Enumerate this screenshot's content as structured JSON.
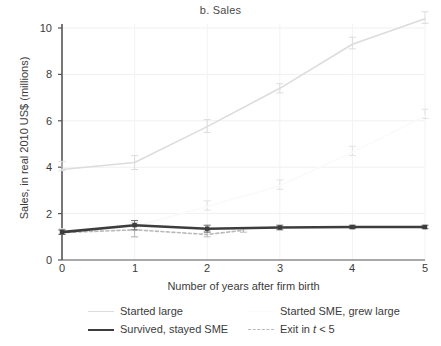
{
  "figure": {
    "title": "b. Sales",
    "xlabel": "Number of years after firm birth",
    "ylabel": "Sales, in real 2010 US$ (millions)"
  },
  "legend": {
    "items": [
      {
        "label": "Started large",
        "style": "solid-light-gray",
        "color": "#dcdcdc"
      },
      {
        "label": "Started SME, grew large",
        "style": "solid-near-white",
        "color": "#fafafa"
      },
      {
        "label": "Survived, stayed SME",
        "style": "solid-dark-thick",
        "color": "#3d3d3d"
      },
      {
        "label": "Exit in t < 5",
        "style": "dashed-gray",
        "color": "#b9b9b9"
      }
    ]
  },
  "axes": {
    "y_ticks": [
      "0",
      "2",
      "4",
      "6",
      "8",
      "10"
    ],
    "x_ticks": [
      "0",
      "1",
      "2",
      "3",
      "4",
      "5"
    ]
  },
  "chart_data": {
    "type": "line",
    "title": "b. Sales",
    "xlabel": "Number of years after firm birth",
    "ylabel": "Sales, in real 2010 US$ (millions)",
    "xlim": [
      0,
      5
    ],
    "ylim": [
      0,
      10.8
    ],
    "x_ticks": [
      0,
      1,
      2,
      3,
      4,
      5
    ],
    "y_ticks": [
      0,
      2,
      4,
      6,
      8,
      10
    ],
    "grid": true,
    "legend_position": "below",
    "error_bars": true,
    "series": [
      {
        "name": "Started large",
        "color": "#dcdcdc",
        "style": "solid",
        "x": [
          0,
          1,
          2,
          3,
          4,
          5
        ],
        "values": [
          3.9,
          4.2,
          5.75,
          7.4,
          9.3,
          10.4
        ],
        "err_low": [
          3.85,
          3.9,
          5.5,
          7.2,
          9.1,
          10.2
        ],
        "err_high": [
          4.25,
          4.5,
          6.05,
          7.6,
          9.6,
          10.7
        ]
      },
      {
        "name": "Started SME, grew large",
        "color": "#fafafa",
        "style": "solid",
        "x": [
          0,
          1,
          2,
          3,
          4,
          5
        ],
        "values": [
          1.25,
          1.45,
          2.3,
          3.2,
          4.65,
          6.2
        ],
        "err_low": [
          1.15,
          1.0,
          2.15,
          3.05,
          4.5,
          6.1
        ],
        "err_high": [
          1.35,
          1.7,
          2.55,
          3.45,
          4.9,
          6.5
        ]
      },
      {
        "name": "Survived, stayed SME",
        "color": "#3d3d3d",
        "style": "solid",
        "x": [
          0,
          1,
          2,
          3,
          4,
          5
        ],
        "values": [
          1.2,
          1.5,
          1.35,
          1.4,
          1.42,
          1.42
        ],
        "err_low": [
          1.1,
          1.3,
          1.2,
          1.3,
          1.35,
          1.35
        ],
        "err_high": [
          1.3,
          1.7,
          1.5,
          1.5,
          1.5,
          1.5
        ]
      },
      {
        "name": "Exit in t < 5",
        "color": "#b9b9b9",
        "style": "dashed",
        "x": [
          0,
          1,
          2,
          2.5
        ],
        "values": [
          1.18,
          1.3,
          1.1,
          1.28
        ],
        "err_low": [
          1.1,
          1.0,
          1.0,
          1.2
        ],
        "err_high": [
          1.28,
          1.6,
          1.25,
          1.35
        ]
      }
    ]
  }
}
